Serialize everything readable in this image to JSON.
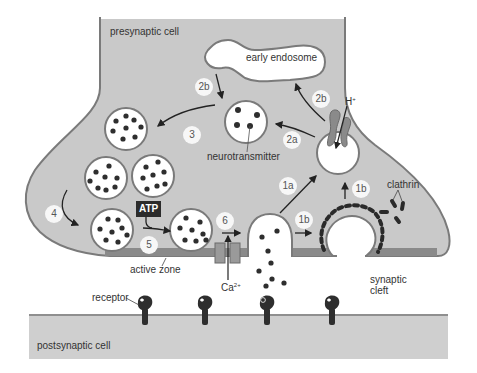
{
  "diagram": {
    "labels": {
      "presynaptic_cell": "presynaptic cell",
      "postsynaptic_cell": "postsynaptic cell",
      "early_endosome": "early endosome",
      "neurotransmitter": "neurotransmitter",
      "clathrin": "clathrin",
      "active_zone": "active zone",
      "synaptic_cleft_1": "synaptic",
      "synaptic_cleft_2": "cleft",
      "receptor": "receptor",
      "atp": "ATP",
      "proton": "H",
      "proton_sup": "+",
      "calcium": "Ca",
      "calcium_sup": "2+"
    },
    "steps": {
      "s1a": "1a",
      "s1b_upper": "1b",
      "s1b_lower": "1b",
      "s2a": "2a",
      "s2b_left": "2b",
      "s2b_right": "2b",
      "s3": "3",
      "s4": "4",
      "s5": "5",
      "s6": "6"
    },
    "colors": {
      "cell_fill": "#c9c9c9",
      "cell_outline": "#7a7a7a",
      "vesicle_fill": "#ffffff",
      "dark": "#2e2e2e",
      "active_zone": "#8a8a8a",
      "step_badge": "#f7f7f7"
    }
  }
}
